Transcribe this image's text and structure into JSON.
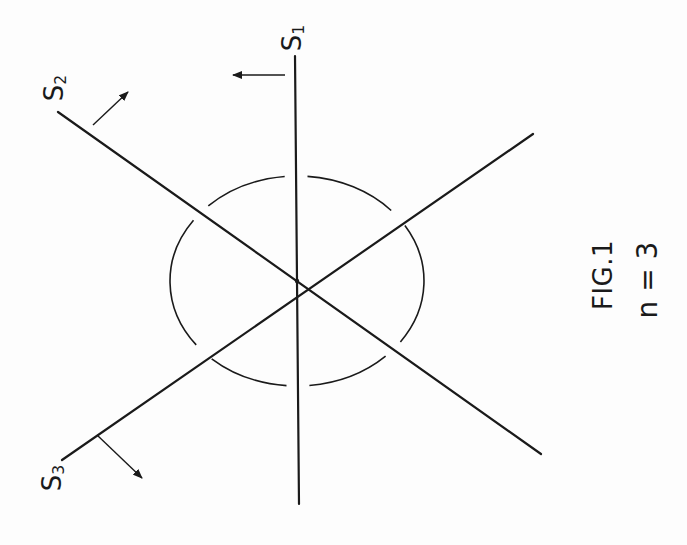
{
  "figure": {
    "caption": "FIG.1",
    "subtitle": "n = 3",
    "stroke_color": "#1a1a1a",
    "background": "#fdfdfd",
    "center": {
      "x": 297,
      "y": 281
    },
    "ellipse": {
      "cx": 297,
      "cy": 281,
      "rx": 127,
      "ry": 105
    },
    "lines": [
      {
        "id": "S1",
        "label": "S",
        "subscript": "1",
        "x1": 295,
        "y1": 56,
        "x2": 299,
        "y2": 504,
        "arrow": {
          "x1": 285,
          "y1": 75,
          "x2": 233,
          "y2": 75
        }
      },
      {
        "id": "S2",
        "label": "S",
        "subscript": "2",
        "x1": 58,
        "y1": 112,
        "x2": 541,
        "y2": 454,
        "arrow": {
          "x1": 93,
          "y1": 125,
          "x2": 128,
          "y2": 92
        }
      },
      {
        "id": "S3",
        "label": "S",
        "subscript": "3",
        "x1": 62,
        "y1": 460,
        "x2": 533,
        "y2": 134,
        "arrow": {
          "x1": 97,
          "y1": 435,
          "x2": 142,
          "y2": 478
        }
      }
    ]
  },
  "labels": {
    "s1": {
      "main": "S",
      "sub": "1"
    },
    "s2": {
      "main": "S",
      "sub": "2"
    },
    "s3": {
      "main": "S",
      "sub": "3"
    }
  }
}
